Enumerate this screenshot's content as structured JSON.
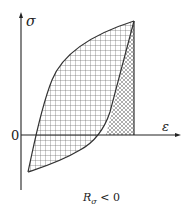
{
  "diagram": {
    "y_axis_label": "σ",
    "x_axis_label": "ε",
    "origin_label": "0",
    "caption": {
      "main": "R",
      "subscript": "σ",
      "relation": " < 0"
    },
    "regions": [
      {
        "name": "hysteresis-loop-area",
        "pattern": "square-grid"
      },
      {
        "name": "elastic-recovery-area",
        "pattern": "diagonal-crosshatch"
      }
    ],
    "colors": {
      "line": "#333333",
      "hatch": "#555555",
      "background": "#ffffff"
    }
  }
}
